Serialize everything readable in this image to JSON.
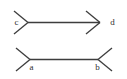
{
  "figure": {
    "background_color": "#ffffff",
    "stroke_color": "#3d3d3d",
    "label_color": "#2e2e2e",
    "stroke_width": 1.3,
    "canvas": {
      "width": 127,
      "height": 79
    },
    "shafts": [
      {
        "name": "top-shaft",
        "x1": 28,
        "y1": 22.5,
        "x2": 100,
        "y2": 22.5,
        "length_px": 72,
        "endpoint_labels": [
          "c",
          "d"
        ],
        "fin_direction": "outward-arrowheads"
      },
      {
        "name": "bottom-shaft",
        "x1": 30,
        "y1": 59.5,
        "x2": 98,
        "y2": 59.5,
        "length_px": 68,
        "endpoint_labels": [
          "a",
          "b"
        ],
        "fin_direction": "outward-tails"
      }
    ],
    "fins": [
      {
        "name": "top-left-fin-upper",
        "x1": 28,
        "y1": 22.5,
        "x2": 14,
        "y2": 11
      },
      {
        "name": "top-left-fin-lower",
        "x1": 28,
        "y1": 22.5,
        "x2": 14,
        "y2": 34
      },
      {
        "name": "top-right-fin-upper",
        "x1": 100,
        "y1": 22.5,
        "x2": 86,
        "y2": 11
      },
      {
        "name": "top-right-fin-lower",
        "x1": 100,
        "y1": 22.5,
        "x2": 86,
        "y2": 34
      },
      {
        "name": "bottom-left-fin-upper",
        "x1": 30,
        "y1": 59.5,
        "x2": 16,
        "y2": 48
      },
      {
        "name": "bottom-left-fin-lower",
        "x1": 30,
        "y1": 59.5,
        "x2": 16,
        "y2": 71
      },
      {
        "name": "bottom-right-fin-upper",
        "x1": 98,
        "y1": 59.5,
        "x2": 112,
        "y2": 48
      },
      {
        "name": "bottom-right-fin-lower",
        "x1": 98,
        "y1": 59.5,
        "x2": 112,
        "y2": 71
      }
    ],
    "labels": [
      {
        "id": "c",
        "text": "c",
        "x": 16.5,
        "y": 23,
        "anchor": "middle"
      },
      {
        "id": "d",
        "text": "d",
        "x": 112.5,
        "y": 23,
        "anchor": "middle"
      },
      {
        "id": "a",
        "text": "a",
        "x": 31.5,
        "y": 67.5,
        "anchor": "middle"
      },
      {
        "id": "b",
        "text": "b",
        "x": 97.5,
        "y": 67.5,
        "anchor": "middle"
      }
    ]
  },
  "chart_data": {
    "type": "diagram",
    "figures": [
      {
        "name": "upper",
        "endpoints": [
          "c",
          "d"
        ],
        "shaft_length_px": 72,
        "fin_type": "arrowhead-in",
        "y": 22.5
      },
      {
        "name": "lower",
        "endpoints": [
          "a",
          "b"
        ],
        "shaft_length_px": 68,
        "fin_type": "tail-out",
        "y": 59.5
      }
    ],
    "labels": [
      "c",
      "d",
      "a",
      "b"
    ]
  }
}
